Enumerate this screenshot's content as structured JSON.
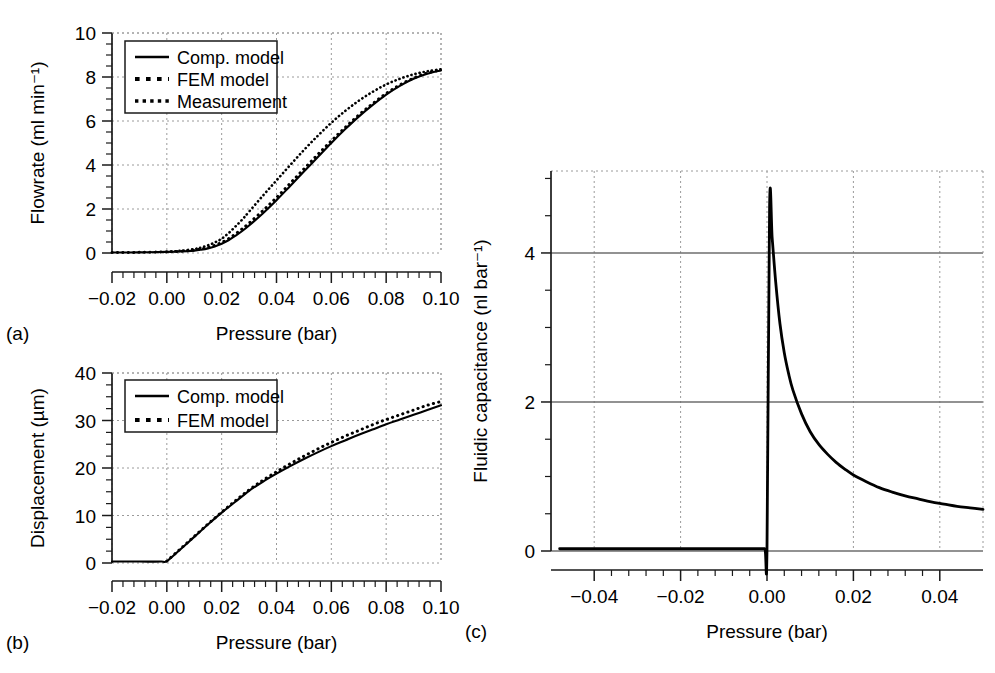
{
  "figure": {
    "panels": [
      {
        "id": "a",
        "letter": "(a)"
      },
      {
        "id": "b",
        "letter": "(b)"
      },
      {
        "id": "c",
        "letter": "(c)"
      }
    ]
  },
  "chart_data": [
    {
      "id": "a",
      "type": "line",
      "title": "",
      "xlabel": "Pressure (bar)",
      "ylabel": "Flowrate (ml min⁻¹)",
      "xlim": [
        -0.02,
        0.1
      ],
      "ylim": [
        0,
        10
      ],
      "xticks": [
        -0.02,
        0.0,
        0.02,
        0.04,
        0.06,
        0.08,
        0.1
      ],
      "xticklabels": [
        "−0.02",
        "0.00",
        "0.02",
        "0.04",
        "0.06",
        "0.08",
        "0.10"
      ],
      "yticks": [
        0,
        2,
        4,
        6,
        8,
        10
      ],
      "yticklabels": [
        "0",
        "2",
        "4",
        "6",
        "8",
        "10"
      ],
      "minor_x_per_interval": 5,
      "minor_y_per_interval": 4,
      "grid": "dashed",
      "legend_position": "upper-left",
      "series": [
        {
          "name": "Comp. model",
          "style": "solid",
          "x": [
            -0.02,
            -0.01,
            0.0,
            0.005,
            0.01,
            0.0125,
            0.015,
            0.0175,
            0.02,
            0.0225,
            0.025,
            0.0275,
            0.03,
            0.035,
            0.04,
            0.045,
            0.05,
            0.055,
            0.06,
            0.065,
            0.07,
            0.075,
            0.08,
            0.085,
            0.09,
            0.095,
            0.1
          ],
          "values": [
            0.02,
            0.03,
            0.05,
            0.07,
            0.11,
            0.15,
            0.21,
            0.3,
            0.42,
            0.58,
            0.78,
            1.0,
            1.25,
            1.8,
            2.4,
            3.05,
            3.7,
            4.35,
            5.0,
            5.62,
            6.2,
            6.72,
            7.2,
            7.6,
            7.92,
            8.15,
            8.3
          ]
        },
        {
          "name": "FEM model",
          "style": "dotted-large",
          "x": [
            -0.02,
            -0.01,
            0.0,
            0.005,
            0.01,
            0.0125,
            0.015,
            0.0175,
            0.02,
            0.0225,
            0.025,
            0.0275,
            0.03,
            0.035,
            0.04,
            0.045,
            0.05,
            0.055,
            0.06,
            0.065,
            0.07,
            0.075,
            0.08,
            0.085,
            0.09,
            0.095,
            0.1
          ],
          "values": [
            0.02,
            0.03,
            0.05,
            0.08,
            0.13,
            0.18,
            0.25,
            0.35,
            0.48,
            0.65,
            0.86,
            1.1,
            1.36,
            1.92,
            2.52,
            3.17,
            3.82,
            4.47,
            5.1,
            5.7,
            6.27,
            6.78,
            7.25,
            7.64,
            7.95,
            8.18,
            8.32
          ]
        },
        {
          "name": "Measurement",
          "style": "dotted-small",
          "x": [
            0.0,
            0.005,
            0.01,
            0.0125,
            0.015,
            0.0175,
            0.02,
            0.0225,
            0.025,
            0.0275,
            0.03,
            0.035,
            0.04,
            0.045,
            0.05,
            0.055,
            0.06,
            0.065,
            0.07,
            0.075,
            0.08,
            0.085,
            0.09,
            0.095,
            0.1
          ],
          "values": [
            0.05,
            0.1,
            0.18,
            0.25,
            0.35,
            0.48,
            0.65,
            0.9,
            1.2,
            1.52,
            1.88,
            2.6,
            3.3,
            4.0,
            4.68,
            5.32,
            5.92,
            6.45,
            6.92,
            7.32,
            7.66,
            7.92,
            8.12,
            8.26,
            8.35
          ]
        }
      ]
    },
    {
      "id": "b",
      "type": "line",
      "title": "",
      "xlabel": "Pressure (bar)",
      "ylabel": "Displacement (µm)",
      "xlim": [
        -0.02,
        0.1
      ],
      "ylim": [
        0,
        40
      ],
      "xticks": [
        -0.02,
        0.0,
        0.02,
        0.04,
        0.06,
        0.08,
        0.1
      ],
      "xticklabels": [
        "−0.02",
        "0.00",
        "0.02",
        "0.04",
        "0.06",
        "0.08",
        "0.10"
      ],
      "yticks": [
        0,
        10,
        20,
        30,
        40
      ],
      "yticklabels": [
        "0",
        "10",
        "20",
        "30",
        "40"
      ],
      "minor_x_per_interval": 5,
      "minor_y_per_interval": 4,
      "grid": "dashed",
      "legend_position": "upper-left",
      "series": [
        {
          "name": "Comp. model",
          "style": "solid",
          "x": [
            -0.02,
            -0.01,
            -0.002,
            0.0,
            0.005,
            0.01,
            0.015,
            0.02,
            0.025,
            0.03,
            0.035,
            0.04,
            0.045,
            0.05,
            0.055,
            0.06,
            0.065,
            0.07,
            0.075,
            0.08,
            0.085,
            0.09,
            0.095,
            0.1
          ],
          "values": [
            0.3,
            0.3,
            0.3,
            0.4,
            2.9,
            5.5,
            8.1,
            10.6,
            12.9,
            15.2,
            17.1,
            18.8,
            20.4,
            21.9,
            23.3,
            24.6,
            25.8,
            27.0,
            28.1,
            29.2,
            30.2,
            31.2,
            32.2,
            33.2
          ]
        },
        {
          "name": "FEM model",
          "style": "dotted-large",
          "x": [
            0.0,
            0.005,
            0.01,
            0.015,
            0.02,
            0.025,
            0.03,
            0.035,
            0.04,
            0.045,
            0.05,
            0.055,
            0.06,
            0.065,
            0.07,
            0.075,
            0.08,
            0.085,
            0.09,
            0.095,
            0.1
          ],
          "values": [
            0.4,
            3.0,
            5.6,
            8.2,
            10.7,
            13.1,
            15.4,
            17.4,
            19.2,
            20.9,
            22.5,
            24.0,
            25.4,
            26.7,
            27.9,
            29.1,
            30.2,
            31.2,
            32.2,
            33.2,
            34.0
          ]
        }
      ]
    },
    {
      "id": "c",
      "type": "line",
      "title": "",
      "xlabel": "Pressure (bar)",
      "ylabel": "Fluidic capacitance (nl bar⁻¹)",
      "xlim": [
        -0.05,
        0.05
      ],
      "ylim": [
        0,
        5.1
      ],
      "xticks": [
        -0.04,
        -0.02,
        0.0,
        0.02,
        0.04
      ],
      "xticklabels": [
        "−0.04",
        "−0.02",
        "0.00",
        "0.02",
        "0.04"
      ],
      "yticks": [
        0,
        2,
        4
      ],
      "yticklabels": [
        "0",
        "2",
        "4"
      ],
      "minor_x_per_interval": 5,
      "minor_y_per_interval": 4,
      "grid": "mixed",
      "legend_position": "none",
      "series": [
        {
          "name": "Fluidic capacitance",
          "style": "solid-thick",
          "x": [
            -0.048,
            -0.04,
            -0.03,
            -0.02,
            -0.01,
            -0.002,
            -0.0005,
            0.0,
            0.0006,
            0.0012,
            0.002,
            0.003,
            0.004,
            0.005,
            0.006,
            0.008,
            0.01,
            0.012,
            0.014,
            0.016,
            0.018,
            0.02,
            0.023,
            0.026,
            0.029,
            0.032,
            0.035,
            0.038,
            0.041,
            0.044,
            0.047,
            0.05
          ],
          "values": [
            0.03,
            0.03,
            0.03,
            0.03,
            0.03,
            0.03,
            0.03,
            0.03,
            4.62,
            4.2,
            3.62,
            3.05,
            2.66,
            2.38,
            2.16,
            1.84,
            1.6,
            1.43,
            1.3,
            1.19,
            1.1,
            1.02,
            0.93,
            0.85,
            0.79,
            0.74,
            0.7,
            0.66,
            0.63,
            0.6,
            0.58,
            0.56
          ]
        }
      ],
      "peak": {
        "x": 0.0006,
        "y": 4.62
      }
    }
  ],
  "legends": {
    "a": {
      "entries": [
        {
          "label": "Comp. model",
          "style": "solid"
        },
        {
          "label": "FEM model",
          "style": "dotted-large"
        },
        {
          "label": "Measurement",
          "style": "dotted-small"
        }
      ]
    },
    "b": {
      "entries": [
        {
          "label": "Comp. model",
          "style": "solid"
        },
        {
          "label": "FEM model",
          "style": "dotted-large"
        }
      ]
    }
  },
  "colors": {
    "axis": "#1a1a1a",
    "curve": "#000000",
    "grid_dashed": "#9a9a9a",
    "grid_solid": "#6e6e6e",
    "background": "#ffffff"
  }
}
